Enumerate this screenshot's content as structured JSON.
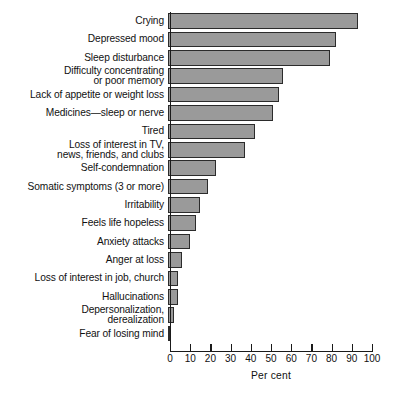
{
  "chart_data": {
    "type": "bar",
    "orientation": "horizontal",
    "title": "",
    "xlabel": "Per cent",
    "ylabel": "",
    "xlim": [
      0,
      100
    ],
    "xticks": [
      0,
      10,
      20,
      30,
      40,
      50,
      60,
      70,
      80,
      90,
      100
    ],
    "grid": false,
    "legend": null,
    "bar_color": "#9a9a9a",
    "bar_edge_color": "#2b2b2b",
    "categories": [
      "Crying",
      "Depressed mood",
      "Sleep disturbance",
      "Difficulty concentrating\nor poor memory",
      "Lack of appetite or weight loss",
      "Medicines—sleep or nerve",
      "Tired",
      "Loss of interest in TV,\nnews, friends, and clubs",
      "Self-condemnation",
      "Somatic symptoms (3 or more)",
      "Irritability",
      "Feels life hopeless",
      "Anxiety attacks",
      "Anger at loss",
      "Loss of interest in job, church",
      "Hallucinations",
      "Depersonalization,\nderealization",
      "Fear of losing mind"
    ],
    "values": [
      94,
      83,
      80,
      57,
      55,
      52,
      43,
      38,
      24,
      20,
      16,
      14,
      11,
      7,
      5,
      5,
      3,
      1
    ]
  }
}
